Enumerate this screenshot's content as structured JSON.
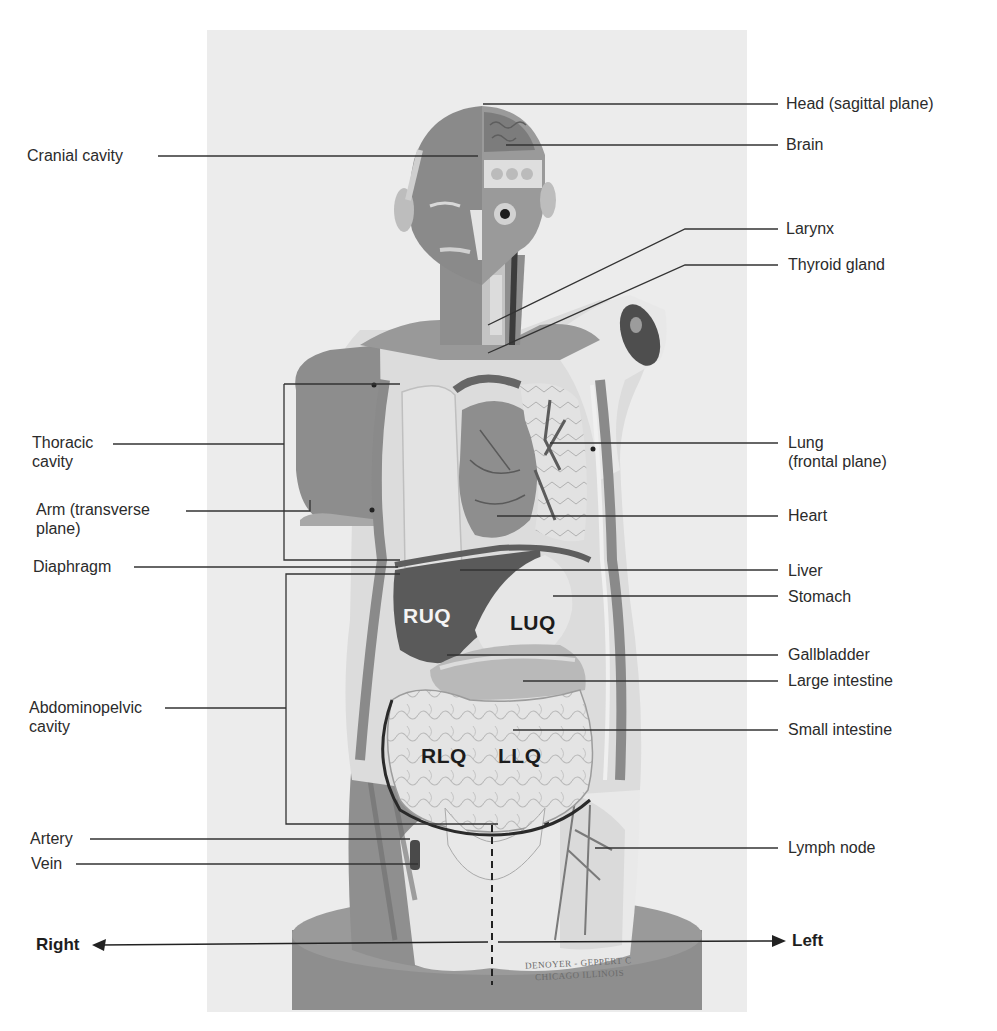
{
  "figure": {
    "colors": {
      "background": "#ffffff",
      "photo_background": "#ececec",
      "muscle": "#8c8c8c",
      "dark_organ": "#5a5a5a",
      "light_organ": "#dcdcdc",
      "base": "#8e8e8e",
      "leader_line": "#333333",
      "label_text": "#2b2b2b"
    }
  },
  "labels_left": [
    {
      "id": "cranial-cavity",
      "text": "Cranial cavity",
      "x": 27,
      "y": 146
    },
    {
      "id": "thoracic-cavity",
      "text": "Thoracic\ncavity",
      "line1": "Thoracic",
      "line2": "cavity",
      "x": 32,
      "y": 433
    },
    {
      "id": "arm",
      "text": "Arm (transverse plane)",
      "line1": "Arm (transverse",
      "line2": "plane)",
      "x": 36,
      "y": 500
    },
    {
      "id": "diaphragm",
      "text": "Diaphragm",
      "x": 33,
      "y": 557
    },
    {
      "id": "abdominopelvic-cavity",
      "text": "Abdominopelvic cavity",
      "line1": "Abdominopelvic",
      "line2": "cavity",
      "x": 29,
      "y": 698
    },
    {
      "id": "artery",
      "text": "Artery",
      "x": 30,
      "y": 831
    },
    {
      "id": "vein",
      "text": "Vein",
      "x": 31,
      "y": 855
    }
  ],
  "labels_right": [
    {
      "id": "head",
      "text": "Head (sagittal plane)",
      "x": 786,
      "y": 95
    },
    {
      "id": "brain",
      "text": "Brain",
      "x": 786,
      "y": 136
    },
    {
      "id": "larynx",
      "text": "Larynx",
      "x": 786,
      "y": 219
    },
    {
      "id": "thyroid-gland",
      "text": "Thyroid gland",
      "x": 788,
      "y": 256
    },
    {
      "id": "lung",
      "text": "Lung (frontal plane)",
      "line1": "Lung",
      "line2": "(frontal plane)",
      "x": 788,
      "y": 434
    },
    {
      "id": "heart",
      "text": "Heart",
      "x": 788,
      "y": 507
    },
    {
      "id": "liver",
      "text": "Liver",
      "x": 788,
      "y": 562
    },
    {
      "id": "stomach",
      "text": "Stomach",
      "x": 788,
      "y": 588
    },
    {
      "id": "gallbladder",
      "text": "Gallbladder",
      "x": 788,
      "y": 640
    },
    {
      "id": "large-intestine",
      "text": "Large intestine",
      "x": 788,
      "y": 667
    },
    {
      "id": "small-intestine",
      "text": "Small intestine",
      "x": 788,
      "y": 716
    },
    {
      "id": "lymph-node",
      "text": "Lymph node",
      "x": 788,
      "y": 834
    }
  ],
  "quadrants": [
    {
      "id": "ruq",
      "text": "RUQ",
      "x": 403,
      "y": 603,
      "tone": "light"
    },
    {
      "id": "luq",
      "text": "LUQ",
      "x": 510,
      "y": 609,
      "tone": "dark"
    },
    {
      "id": "rlq",
      "text": "RLQ",
      "x": 421,
      "y": 743,
      "tone": "dark"
    },
    {
      "id": "llq",
      "text": "LLQ",
      "x": 498,
      "y": 743,
      "tone": "dark"
    }
  ],
  "directions": {
    "right": {
      "text": "Right",
      "x": 36,
      "y": 935
    },
    "left": {
      "text": "Left",
      "x": 792,
      "y": 931
    }
  },
  "model_maker_text": {
    "line1": "DENOYER - GEPPERT C",
    "line2": "CHICAGO ILLINOIS"
  }
}
